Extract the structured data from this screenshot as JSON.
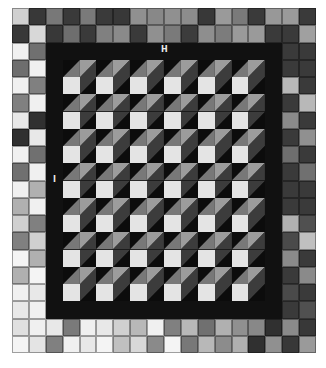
{
  "diagram": {
    "type": "quilt-pattern",
    "grid": {
      "columns": 18,
      "rows": 20
    },
    "labels": [
      {
        "id": "H",
        "text": "H",
        "x": 161,
        "y": 46
      },
      {
        "id": "I",
        "text": "I",
        "x": 53,
        "y": 176
      }
    ],
    "colors": {
      "background": "#ffffff",
      "inner_border": "#111111",
      "cube_top_left": "#787878",
      "cube_top_right": "#9c9c9c",
      "cube_side_dark": "#3c3c3c",
      "cube_face_light": "#e4e4e4",
      "cube_shadow": "#0c0c0c"
    },
    "cube_region": {
      "col_start": 3,
      "row_start": 3,
      "cubes_across": 6,
      "cubes_down": 7,
      "cube_size_cells": 2
    },
    "outer_border": {
      "width_cells": 2,
      "top_rows": [
        [
          "#d0d0d0",
          "#383838",
          "#787878",
          "#3a3a3a",
          "#7a7a7a",
          "#3a3a3a",
          "#383838",
          "#909090",
          "#888888",
          "#909090",
          "#8c8c8c",
          "#383838",
          "#9a9a9a",
          "#7a7a7a",
          "#3a3a3a",
          "#989898",
          "#9a9a9a",
          "#3a3a3a"
        ],
        [
          "#383838",
          "#d8d8d8",
          "#383838",
          "#6e6e6e",
          "#3a3a3a",
          "#808080",
          "#8a8a8a",
          "#3a3a3a",
          "#909090",
          "#7a7a7a",
          "#3c3c3c",
          "#8e8e8e",
          "#7c7c7c",
          "#9a9a9a",
          "#9a9a9a",
          "#3a3a3a",
          "#3a3a3a",
          "#a0a0a0"
        ]
      ],
      "bottom_rows": [
        [
          "#e0e0e0",
          "#f0f0f0",
          "#e8e8e8",
          "#7a7a7a",
          "#f0f0f0",
          "#e8e8e8",
          "#d0d0d0",
          "#b8b8b8",
          "#f0f0f0",
          "#808080",
          "#b8b8b8",
          "#707070",
          "#b0b0b0",
          "#909090",
          "#888888",
          "#303030",
          "#8a8a8a",
          "#383838"
        ],
        [
          "#f4f4f4",
          "#e4e4e4",
          "#808080",
          "#f0f0f0",
          "#e8e8e8",
          "#f4f4f4",
          "#c0c0c0",
          "#d8d8d8",
          "#8a8a8a",
          "#f4f4f4",
          "#787878",
          "#b8b8b8",
          "#8c8c8c",
          "#b0b0b0",
          "#303030",
          "#909090",
          "#383838",
          "#9a9a9a"
        ]
      ],
      "left_cols": [
        [
          "#f0f0f0",
          "#707070"
        ],
        [
          "#6e6e6e",
          "#f0f0f0"
        ],
        [
          "#f0f0f0",
          "#808080"
        ],
        [
          "#808080",
          "#f0f0f0"
        ],
        [
          "#e8e8e8",
          "#303030"
        ],
        [
          "#303030",
          "#e8e8e8"
        ],
        [
          "#f0f0f0",
          "#707070"
        ],
        [
          "#707070",
          "#f0f0f0"
        ],
        [
          "#f0f0f0",
          "#b0b0b0"
        ],
        [
          "#b0b0b0",
          "#f0f0f0"
        ],
        [
          "#d0d0d0",
          "#808080"
        ],
        [
          "#808080",
          "#d0d0d0"
        ],
        [
          "#f4f4f4",
          "#b0b0b0"
        ],
        [
          "#b0b0b0",
          "#f4f4f4"
        ],
        [
          "#f0f0f0",
          "#e8e8e8"
        ],
        [
          "#e8e8e8",
          "#f0f0f0"
        ]
      ],
      "right_cols": [
        [
          "#3a3a3a",
          "#3a3a3a"
        ],
        [
          "#3a3a3a",
          "#3a3a3a"
        ],
        [
          "#b8b8b8",
          "#3a3a3a"
        ],
        [
          "#3a3a3a",
          "#b8b8b8"
        ],
        [
          "#8a8a8a",
          "#3a3a3a"
        ],
        [
          "#3a3a3a",
          "#909090"
        ],
        [
          "#6e6e6e",
          "#3a3a3a"
        ],
        [
          "#3a3a3a",
          "#707070"
        ],
        [
          "#3a3a3a",
          "#3a3a3a"
        ],
        [
          "#3a3a3a",
          "#3a3a3a"
        ],
        [
          "#b0b0b0",
          "#505050"
        ],
        [
          "#4a4a4a",
          "#c0c0c0"
        ],
        [
          "#8a8a8a",
          "#3a3a3a"
        ],
        [
          "#3a3a3a",
          "#8a8a8a"
        ],
        [
          "#4a4a4a",
          "#3a3a3a"
        ],
        [
          "#3a3a3a",
          "#505050"
        ]
      ]
    }
  }
}
